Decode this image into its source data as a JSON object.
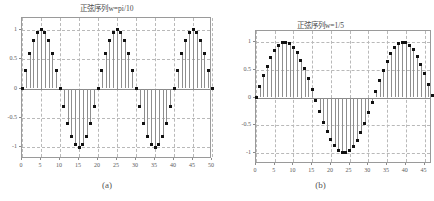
{
  "figure": {
    "background": "#ffffff",
    "stem_color": "#8e8e8e",
    "marker_color": "#111111",
    "grid_color": "#b9b9b9",
    "axis_color": "#9a9a9a"
  },
  "panels": [
    {
      "caption": "(a)",
      "title": "正弦序列w=pi/10"
    },
    {
      "caption": "(b)",
      "title": "正弦序列w=1/5"
    }
  ],
  "chart_data": [
    {
      "type": "line",
      "title": "正弦序列w=pi/10",
      "subtitle": "(a)",
      "xlabel": "",
      "ylabel": "",
      "xlim": [
        0,
        50
      ],
      "ylim": [
        -1.2,
        1.2
      ],
      "grid": true,
      "legend": null,
      "xticks": [
        0,
        5,
        10,
        15,
        20,
        25,
        30,
        35,
        40,
        45,
        50
      ],
      "xticklabels": [
        "0",
        "5",
        "10",
        "15",
        "20",
        "25",
        "30",
        "35",
        "40",
        "45",
        "50"
      ],
      "yticks": [
        -1,
        -0.5,
        0,
        0.5,
        1
      ],
      "yticklabels": [
        "-1",
        "-0.5",
        "0",
        "0.5",
        "1"
      ],
      "series": [
        {
          "name": "sin(pi*n/10)",
          "plot_style": "stem",
          "x": [
            0,
            1,
            2,
            3,
            4,
            5,
            6,
            7,
            8,
            9,
            10,
            11,
            12,
            13,
            14,
            15,
            16,
            17,
            18,
            19,
            20,
            21,
            22,
            23,
            24,
            25,
            26,
            27,
            28,
            29,
            30,
            31,
            32,
            33,
            34,
            35,
            36,
            37,
            38,
            39,
            40,
            41,
            42,
            43,
            44,
            45,
            46,
            47,
            48,
            49,
            50
          ],
          "values": [
            0,
            0.309,
            0.588,
            0.809,
            0.951,
            1,
            0.951,
            0.809,
            0.588,
            0.309,
            0,
            -0.309,
            -0.588,
            -0.809,
            -0.951,
            -1,
            -0.951,
            -0.809,
            -0.588,
            -0.309,
            0,
            0.309,
            0.588,
            0.809,
            0.951,
            1,
            0.951,
            0.809,
            0.588,
            0.309,
            0,
            -0.309,
            -0.588,
            -0.809,
            -0.951,
            -1,
            -0.951,
            -0.809,
            -0.588,
            -0.309,
            0,
            0.309,
            0.588,
            0.809,
            0.951,
            1,
            0.951,
            0.809,
            0.588,
            0.309,
            0
          ]
        }
      ]
    },
    {
      "type": "line",
      "title": "正弦序列w=1/5",
      "subtitle": "(b)",
      "xlabel": "",
      "ylabel": "",
      "xlim": [
        0,
        47
      ],
      "ylim": [
        -1.2,
        1.2
      ],
      "grid": true,
      "legend": null,
      "xticks": [
        0,
        5,
        10,
        15,
        20,
        25,
        30,
        35,
        40,
        45
      ],
      "xticklabels": [
        "0",
        "5",
        "10",
        "15",
        "20",
        "25",
        "30",
        "35",
        "40",
        "45"
      ],
      "yticks": [
        -1,
        -0.5,
        0,
        0.5,
        1
      ],
      "yticklabels": [
        "-1",
        "-0.5",
        "0",
        "0.5",
        "1"
      ],
      "series": [
        {
          "name": "sin(n/5)",
          "plot_style": "stem",
          "x": [
            0,
            1,
            2,
            3,
            4,
            5,
            6,
            7,
            8,
            9,
            10,
            11,
            12,
            13,
            14,
            15,
            16,
            17,
            18,
            19,
            20,
            21,
            22,
            23,
            24,
            25,
            26,
            27,
            28,
            29,
            30,
            31,
            32,
            33,
            34,
            35,
            36,
            37,
            38,
            39,
            40,
            41,
            42,
            43,
            44,
            45,
            46,
            47
          ],
          "values": [
            0,
            0.199,
            0.389,
            0.565,
            0.717,
            0.841,
            0.932,
            0.985,
            0.999,
            0.974,
            0.909,
            0.808,
            0.675,
            0.516,
            0.335,
            0.141,
            -0.058,
            -0.255,
            -0.443,
            -0.612,
            -0.757,
            -0.872,
            -0.951,
            -0.993,
            -0.996,
            -0.959,
            -0.884,
            -0.773,
            -0.631,
            -0.464,
            -0.279,
            -0.083,
            0.117,
            0.311,
            0.494,
            0.656,
            0.793,
            0.898,
            0.967,
            0.999,
            0.991,
            0.944,
            0.86,
            0.743,
            0.596,
            0.426,
            0.239,
            0.042
          ]
        }
      ]
    }
  ]
}
